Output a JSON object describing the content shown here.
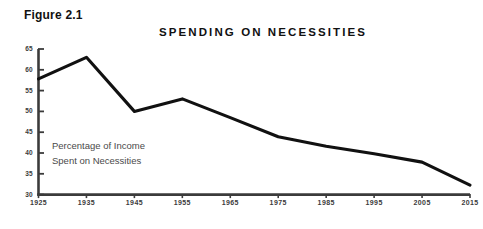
{
  "figure": {
    "label": "Figure 2.1"
  },
  "annotation": {
    "line1": "Percentage of Income",
    "line2": "Spent on Necessities"
  },
  "colors": {
    "line": "#111111",
    "axis": "#3b3b3b",
    "tick_text": "#3b3b3b",
    "annotation_text": "#4a4a4a",
    "background": "#ffffff"
  },
  "chart_data": {
    "type": "line",
    "title": "SPENDING ON NECESSITIES",
    "xlabel": "",
    "ylabel": "",
    "x": [
      1925,
      1935,
      1945,
      1955,
      1965,
      1975,
      1985,
      1995,
      2005,
      2015
    ],
    "categories": [
      "1925",
      "1935",
      "1945",
      "1955",
      "1965",
      "1975",
      "1985",
      "1995",
      "2005",
      "2015"
    ],
    "values": [
      57.8,
      63.0,
      50.0,
      53.0,
      48.5,
      43.9,
      41.6,
      39.8,
      37.8,
      32.3
    ],
    "series": [
      {
        "name": "Percentage of Income Spent on Necessities",
        "values": [
          57.8,
          63.0,
          50.0,
          53.0,
          48.5,
          43.9,
          41.6,
          39.8,
          37.8,
          32.3
        ]
      }
    ],
    "ylim": [
      30,
      65
    ],
    "yticks": [
      30,
      35,
      40,
      45,
      50,
      55,
      60,
      65
    ],
    "ytick_labels": [
      "30",
      "35",
      "40",
      "45",
      "50",
      "55",
      "60",
      "65"
    ],
    "xlim": [
      1925,
      2015
    ],
    "xticks": [
      1925,
      1935,
      1945,
      1955,
      1965,
      1975,
      1985,
      1995,
      2005,
      2015
    ],
    "xtick_labels": [
      "1925",
      "1935",
      "1945",
      "1955",
      "1965",
      "1975",
      "1985",
      "1995",
      "2005",
      "2015"
    ],
    "grid": false,
    "legend": false,
    "annotations": [
      "Percentage of Income",
      "Spent on Necessities"
    ]
  }
}
